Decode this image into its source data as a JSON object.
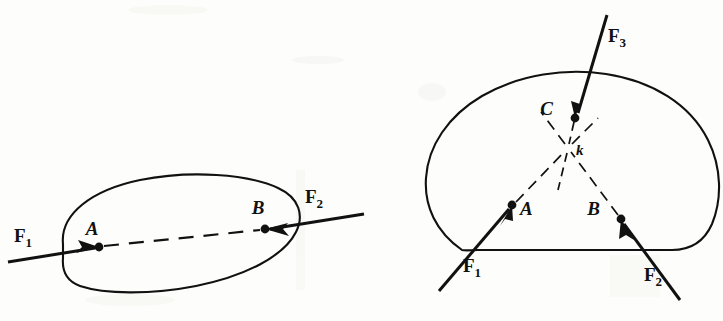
{
  "figure": {
    "domain_type": "diagram",
    "background_color": "#fdfdfb",
    "ink_color": "#111111",
    "width": 723,
    "height": 321
  },
  "left_diagram": {
    "name": "two-force-body",
    "caption": "Rigid body with two collinear forces applied at points A and B",
    "body_shape": "tilted elongated oval",
    "forces": [
      {
        "label": "F",
        "subscript": "1",
        "applied_at": "A",
        "direction": "enters from lower-left, points right-up",
        "label_x": 14,
        "label_y": 242,
        "tail_x": 10,
        "tail_y": 261,
        "tip_x": 99,
        "tip_y": 247
      },
      {
        "label": "F",
        "subscript": "2",
        "applied_at": "B",
        "direction": "enters from upper-right, points left-down",
        "label_x": 305,
        "label_y": 203,
        "tail_x": 362,
        "tail_y": 214,
        "tip_x": 265,
        "tip_y": 229
      }
    ],
    "points": [
      {
        "label": "A",
        "x": 99,
        "y": 247,
        "label_x": 92,
        "label_y": 235
      },
      {
        "label": "B",
        "x": 265,
        "y": 229,
        "label_x": 258,
        "label_y": 214
      }
    ],
    "action_line": {
      "style": "dashed",
      "from": "A",
      "to": "B",
      "description": "common line of action joining A and B"
    }
  },
  "right_diagram": {
    "name": "three-force-concurrent-body",
    "caption": "Rigid body with three concurrent forces whose lines of action meet at point k",
    "body_shape": "rounded irregular blob",
    "concurrency_point": {
      "label": "k",
      "x": 568,
      "y": 148,
      "label_x": 576,
      "label_y": 155
    },
    "forces": [
      {
        "label": "F",
        "subscript": "1",
        "applied_at": "A",
        "direction": "enters from lower-left, points up-right",
        "label_x": 463,
        "label_y": 272,
        "tail_x": 441,
        "tail_y": 289,
        "tip_x": 512,
        "tip_y": 205
      },
      {
        "label": "F",
        "subscript": "2",
        "applied_at": "B",
        "direction": "enters from lower-right, points up-left",
        "label_x": 644,
        "label_y": 281,
        "tail_x": 678,
        "tail_y": 298,
        "tip_x": 621,
        "tip_y": 219
      },
      {
        "label": "F",
        "subscript": "3",
        "applied_at": "C",
        "direction": "enters from top, points down-left",
        "label_x": 608,
        "label_y": 42,
        "tail_x": 607,
        "tail_y": 16,
        "tip_x": 575,
        "tip_y": 118
      }
    ],
    "points": [
      {
        "label": "A",
        "x": 512,
        "y": 205,
        "label_x": 520,
        "label_y": 215
      },
      {
        "label": "B",
        "x": 621,
        "y": 219,
        "label_x": 600,
        "label_y": 215
      },
      {
        "label": "C",
        "x": 575,
        "y": 118,
        "label_x": 553,
        "label_y": 115
      }
    ],
    "action_lines": {
      "style": "dashed",
      "segments": [
        {
          "from": "A",
          "to": "k"
        },
        {
          "from": "B",
          "to": "k"
        },
        {
          "from": "C",
          "to": "k"
        }
      ],
      "description": "dashed lines of action from each application point converging at k, with short stubs continuing past k"
    }
  }
}
